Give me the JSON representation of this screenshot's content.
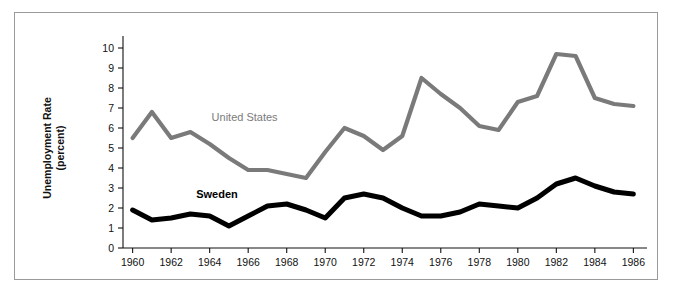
{
  "chart_data": {
    "type": "line",
    "title": "",
    "xlabel": "",
    "ylabel": "Unemployment Rate\n(percent)",
    "ylabel_line1": "Unemployment Rate",
    "ylabel_line2": "(percent)",
    "xlim": [
      1959.5,
      1986.5
    ],
    "ylim": [
      0,
      10.5
    ],
    "grid": false,
    "legend_position": "inline-annotation",
    "y_ticks": [
      0,
      1,
      2,
      3,
      4,
      5,
      6,
      7,
      8,
      9,
      10
    ],
    "y_tick_labels": [
      "0",
      "1",
      "2",
      "3",
      "4",
      "5",
      "6",
      "7",
      "8",
      "9",
      "10"
    ],
    "x_ticks": [
      1960,
      1962,
      1964,
      1966,
      1968,
      1970,
      1972,
      1974,
      1976,
      1978,
      1980,
      1982,
      1984,
      1986
    ],
    "x_tick_labels": [
      "1960",
      "1962",
      "1964",
      "1966",
      "1968",
      "1970",
      "1972",
      "1974",
      "1976",
      "1978",
      "1980",
      "1982",
      "1984",
      "1986"
    ],
    "x": [
      1960,
      1961,
      1962,
      1963,
      1964,
      1965,
      1966,
      1967,
      1968,
      1969,
      1970,
      1971,
      1972,
      1973,
      1974,
      1975,
      1976,
      1977,
      1978,
      1979,
      1980,
      1981,
      1982,
      1983,
      1984,
      1985,
      1986
    ],
    "series": [
      {
        "name": "United States",
        "color": "#7a7a7a",
        "line_width": 4.2,
        "label_x": 1964.1,
        "label_y": 6.35,
        "values": [
          5.5,
          6.8,
          5.5,
          5.8,
          5.2,
          4.5,
          3.9,
          3.9,
          3.7,
          3.5,
          4.8,
          6.0,
          5.6,
          4.9,
          5.6,
          8.5,
          7.7,
          7.0,
          6.1,
          5.9,
          7.3,
          7.6,
          9.7,
          9.6,
          7.5,
          7.2,
          7.1
        ]
      },
      {
        "name": "Sweden",
        "color": "#000000",
        "line_width": 5.0,
        "label_x": 1963.3,
        "label_y": 2.52,
        "values": [
          1.9,
          1.4,
          1.5,
          1.7,
          1.6,
          1.1,
          1.6,
          2.1,
          2.2,
          1.9,
          1.5,
          2.5,
          2.7,
          2.5,
          2.0,
          1.6,
          1.6,
          1.8,
          2.2,
          2.1,
          2.0,
          2.5,
          3.2,
          3.5,
          3.1,
          2.8,
          2.7
        ]
      }
    ]
  },
  "figure": {
    "background_color": "#ffffff",
    "frame_border_color": "#9a9a9a",
    "axis_color": "#111111"
  }
}
